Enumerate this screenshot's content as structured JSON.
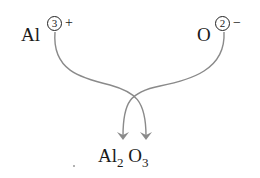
{
  "diagram": {
    "type": "ionic-charge-crossover",
    "cation": {
      "symbol": "Al",
      "charge_number": "3",
      "charge_sign": "+"
    },
    "anion": {
      "symbol": "O",
      "charge_number": "2",
      "charge_sign": "−"
    },
    "product": {
      "element1": "Al",
      "subscript1": "2",
      "element2": "O",
      "subscript2": "3"
    },
    "arrow_color": "#8a8a8a"
  }
}
